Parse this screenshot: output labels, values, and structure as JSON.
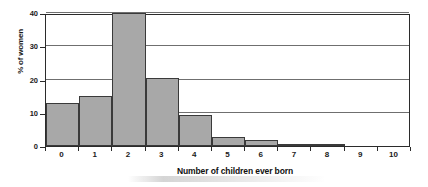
{
  "chart_data": {
    "type": "bar",
    "title": "",
    "subtitle": "",
    "xlabel": "Number of children ever born",
    "ylabel": "% of women",
    "categories": [
      "0",
      "1",
      "2",
      "3",
      "4",
      "5",
      "6",
      "7",
      "8",
      "9",
      "10"
    ],
    "values": [
      12.8,
      15.1,
      40.5,
      20.5,
      9.4,
      2.8,
      1.7,
      0.5,
      0.4,
      0.0,
      0.0
    ],
    "series": [
      {
        "name": "% of women",
        "values": [
          12.8,
          15.1,
          40.5,
          20.5,
          9.4,
          2.8,
          1.7,
          0.5,
          0.4,
          0.0,
          0.0
        ]
      }
    ],
    "ylim": [
      0,
      40
    ],
    "xlim": [
      -0.5,
      10.5
    ],
    "yticks": [
      0,
      10,
      20,
      30,
      40
    ],
    "ytick_labels": [
      "0",
      "10",
      "20",
      "30",
      "40"
    ],
    "xtick_labels": [
      "0",
      "1",
      "2",
      "3",
      "4",
      "5",
      "6",
      "7",
      "8",
      "9",
      "10"
    ],
    "grid": "horizontal",
    "legend": "none",
    "colors": {
      "bar_fill": "#a8a8a8",
      "bar_stroke": "#3a3a3a",
      "plot_background": "#ffffff",
      "axis": "#2b2b2b",
      "gridline": "#6f6f6f",
      "text": "#1a1a1a"
    }
  }
}
